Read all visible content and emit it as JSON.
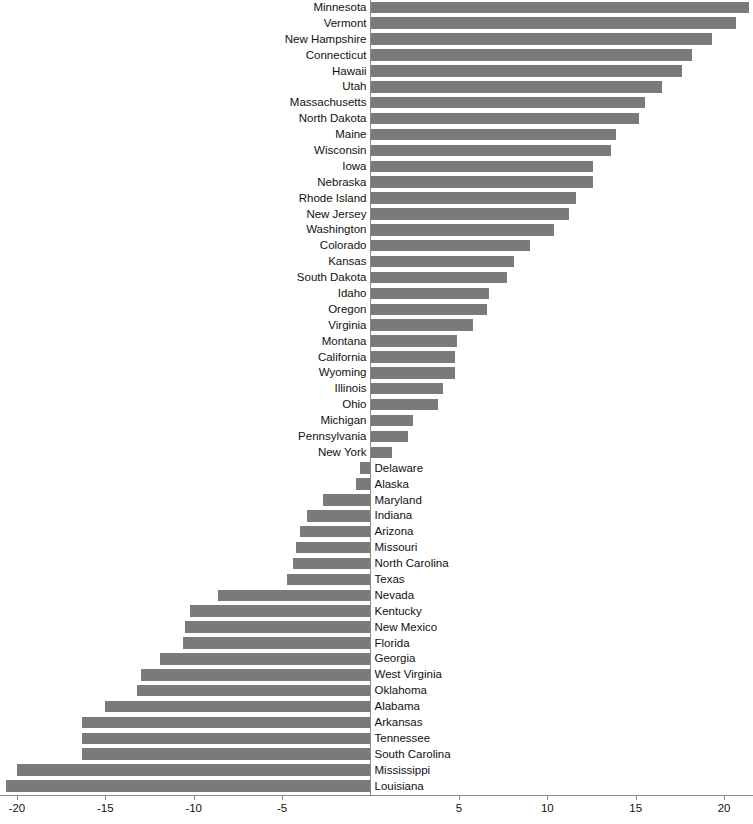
{
  "chart": {
    "accent_color": "#7a7a7a",
    "axis_color": "#8a8a8a",
    "background": "#ffffff"
  },
  "axis": {
    "ticks": [
      {
        "value": -20,
        "label": "-20"
      },
      {
        "value": -15,
        "label": "-15"
      },
      {
        "value": -10,
        "label": "-10"
      },
      {
        "value": -5,
        "label": "-5"
      },
      {
        "value": 5,
        "label": "5"
      },
      {
        "value": 10,
        "label": "10"
      },
      {
        "value": 15,
        "label": "15"
      },
      {
        "value": 20,
        "label": "20"
      }
    ]
  },
  "chart_data": {
    "type": "bar",
    "orientation": "horizontal",
    "title": "",
    "xlabel": "",
    "ylabel": "",
    "xlim": [
      -21.5,
      21.5
    ],
    "grid": false,
    "legend": null,
    "zero_baseline": true,
    "categories": [
      "Minnesota",
      "Vermont",
      "New Hampshire",
      "Connecticut",
      "Hawaii",
      "Utah",
      "Massachusetts",
      "North Dakota",
      "Maine",
      "Wisconsin",
      "Iowa",
      "Nebraska",
      "Rhode Island",
      "New Jersey",
      "Washington",
      "Colorado",
      "Kansas",
      "South Dakota",
      "Idaho",
      "Oregon",
      "Virginia",
      "Montana",
      "California",
      "Wyoming",
      "Illinois",
      "Ohio",
      "Michigan",
      "Pennsylvania",
      "New York",
      "Delaware",
      "Alaska",
      "Maryland",
      "Indiana",
      "Arizona",
      "Missouri",
      "North Carolina",
      "Texas",
      "Nevada",
      "Kentucky",
      "New Mexico",
      "Florida",
      "Georgia",
      "West Virginia",
      "Oklahoma",
      "Alabama",
      "Arkansas",
      "Tennessee",
      "South Carolina",
      "Mississippi",
      "Louisiana"
    ],
    "values": [
      21.4,
      20.7,
      19.3,
      18.2,
      17.6,
      16.5,
      15.5,
      15.2,
      13.9,
      13.6,
      12.6,
      12.6,
      11.6,
      11.2,
      10.4,
      9.0,
      8.1,
      7.7,
      6.7,
      6.6,
      5.8,
      4.9,
      4.8,
      4.8,
      4.1,
      3.8,
      2.4,
      2.1,
      1.2,
      -0.6,
      -0.8,
      -2.7,
      -3.6,
      -4.0,
      -4.2,
      -4.4,
      -4.7,
      -8.6,
      -10.2,
      -10.5,
      -10.6,
      -11.9,
      -13.0,
      -13.2,
      -15.0,
      -16.3,
      -16.3,
      -16.3,
      -20.0,
      -20.6
    ]
  }
}
